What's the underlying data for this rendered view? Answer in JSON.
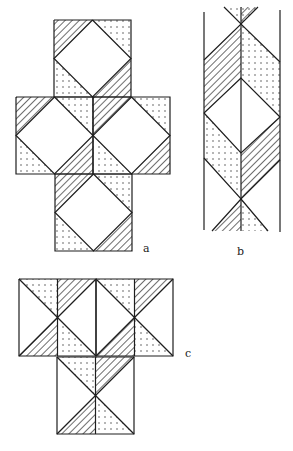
{
  "colors": {
    "ink": "#1e1e1e",
    "paper": "#ffffff",
    "dot": "#333333"
  },
  "labels": [
    {
      "id": "a",
      "text": "a",
      "x": 143,
      "y": 242
    },
    {
      "id": "b",
      "text": "b",
      "x": 237,
      "y": 245
    },
    {
      "id": "c",
      "text": "c",
      "x": 185,
      "y": 347
    }
  ],
  "figure_a": {
    "squares": [
      {
        "x": 54,
        "y": 20,
        "s": 77
      },
      {
        "x": 16,
        "y": 97,
        "s": 77
      },
      {
        "x": 93,
        "y": 97,
        "s": 77
      },
      {
        "x": 55,
        "y": 174,
        "s": 77
      }
    ],
    "corner_fills": {
      "tl": "hatch",
      "tr": "dots",
      "bl": "dots",
      "br": "hatch"
    },
    "center": "diamond-blank"
  },
  "figure_b": {
    "left_x": 204,
    "center_x": 241,
    "right_x": 280,
    "top_y": 10,
    "bottom_y": 231,
    "polygons": [
      {
        "fill": "dots",
        "points": "224,7 258,7 241,24"
      },
      {
        "fill": "hatch",
        "points": "241,7 258,7 241,24"
      },
      {
        "fill": "hatch",
        "points": "241,24 204,60 204,113 241,78"
      },
      {
        "fill": "dots",
        "points": "241,24 280,62 280,117 241,78"
      },
      {
        "fill": "blank",
        "points": "241,78 204,113 241,153 280,117"
      },
      {
        "fill": "dots",
        "points": "204,113 241,153 241,199 204,158"
      },
      {
        "fill": "hatch",
        "points": "280,117 241,153 241,199 280,160"
      },
      {
        "fill": "hatch",
        "points": "241,199 212,231 241,231"
      },
      {
        "fill": "dots",
        "points": "241,199 268,231 241,231"
      }
    ],
    "lines": [
      "204,12 204,230",
      "280,10 280,232",
      "241,7 241,231",
      "224,7 241,24 258,7",
      "204,60 241,24 280,62",
      "204,113 241,78 280,117",
      "204,113 241,153 280,117",
      "204,158 241,199 280,160",
      "212,231 241,199 268,231"
    ]
  },
  "figure_c": {
    "squares": [
      {
        "x": 19,
        "y": 279,
        "s": 77
      },
      {
        "x": 96,
        "y": 279,
        "s": 77
      },
      {
        "x": 57,
        "y": 357,
        "s": 77
      }
    ],
    "quadrant_fills": {
      "top_left_half": "dots",
      "top_right_half": "hatch",
      "bottom_left_half": "hatch",
      "bottom_right_half": "dots"
    }
  }
}
